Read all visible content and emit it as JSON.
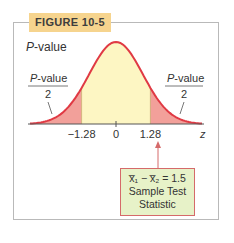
{
  "figure": {
    "label": "FIGURE 10-5",
    "title_italic": "P",
    "title_rest": "-value",
    "left_tail_label": {
      "numerator_italic": "P",
      "numerator_rest": "-value",
      "denominator": "2"
    },
    "right_tail_label": {
      "numerator_italic": "P",
      "numerator_rest": "-value",
      "denominator": "2"
    },
    "axis_label": "z",
    "tick_labels": [
      "−1.28",
      "0",
      "1.28"
    ],
    "callout": {
      "line1": "x̅₁ − x̅₂ = 1.5",
      "line2": "Sample Test",
      "line3": "Statistic"
    },
    "colors": {
      "curve": "#e03a44",
      "tail_fill": "#f2a09a",
      "center_fill": "#fdf6c3",
      "tag_bg": "#f6d48e",
      "callout_bg": "#e7f2c8"
    }
  },
  "chart_data": {
    "type": "area",
    "title": "P-value",
    "xlabel": "z",
    "ylabel": "",
    "distribution": "standard normal",
    "xlim": [
      -3.2,
      3.2
    ],
    "ticks": [
      -1.28,
      0,
      1.28
    ],
    "critical_values": [
      -1.28,
      1.28
    ],
    "shaded_tails": [
      "z < -1.28",
      "z > 1.28"
    ],
    "tail_area_label": "P-value / 2",
    "test_statistic_marker": 1.28,
    "annotation": "x̄1 − x̄2 = 1.5 Sample Test Statistic"
  }
}
